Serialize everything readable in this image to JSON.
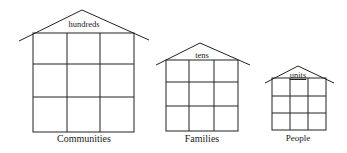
{
  "houses": [
    {
      "roof_label": "hundreds",
      "caption": "Communities"
    },
    {
      "roof_label": "tens",
      "caption": "Families"
    },
    {
      "roof_label": "units",
      "caption": "People"
    }
  ],
  "colors": {
    "stroke": "#222222",
    "background": "#ffffff"
  }
}
